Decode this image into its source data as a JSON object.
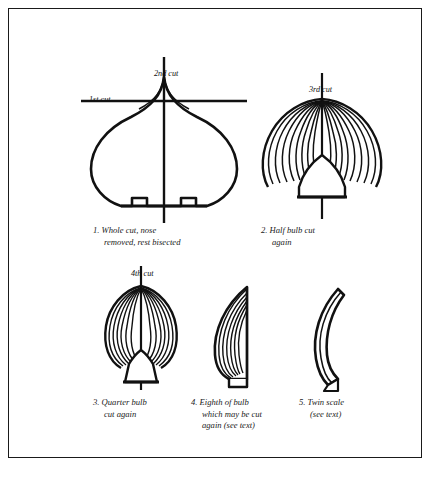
{
  "figure": {
    "border_color": "#1a1a1a",
    "background": "#ffffff",
    "ink_color": "#111111"
  },
  "cut_labels": {
    "first": "1st cut",
    "second": "2nd cut",
    "third": "3rd cut",
    "fourth": "4th cut"
  },
  "panels": [
    {
      "number": "1.",
      "caption": "1.  Whole cut, nose\nremoved, rest bisected",
      "name": "whole-bulb"
    },
    {
      "number": "2.",
      "caption": "2.  Half bulb cut\nagain",
      "name": "half-bulb"
    },
    {
      "number": "3.",
      "caption": "3.  Quarter bulb\ncut again",
      "name": "quarter-bulb"
    },
    {
      "number": "4.",
      "caption": "4.  Eighth of bulb\nwhich may be cut\nagain (see text)",
      "name": "eighth-bulb"
    },
    {
      "number": "5.",
      "caption": "5.  Twin scale\n(see text)",
      "name": "twin-scale"
    }
  ]
}
